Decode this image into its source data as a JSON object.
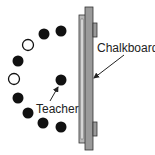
{
  "labels": {
    "chalkboard": "Chalkboard",
    "teacher": "Teacher"
  },
  "colors": {
    "board_fill": "#9a9a9a",
    "board_frame": "#b8b8b8",
    "outline": "#333333",
    "student_filled": "#111111",
    "student_empty": "#ffffff"
  },
  "seats": [
    {
      "x": 44,
      "y": 34,
      "filled": true
    },
    {
      "x": 61,
      "y": 31,
      "filled": true
    },
    {
      "x": 28,
      "y": 45,
      "filled": false
    },
    {
      "x": 18,
      "y": 61,
      "filled": true
    },
    {
      "x": 14,
      "y": 79,
      "filled": false
    },
    {
      "x": 18,
      "y": 98,
      "filled": true
    },
    {
      "x": 28,
      "y": 113,
      "filled": true
    },
    {
      "x": 43,
      "y": 123,
      "filled": true
    },
    {
      "x": 61,
      "y": 127,
      "filled": true
    }
  ],
  "teacher": {
    "x": 61,
    "y": 80
  }
}
